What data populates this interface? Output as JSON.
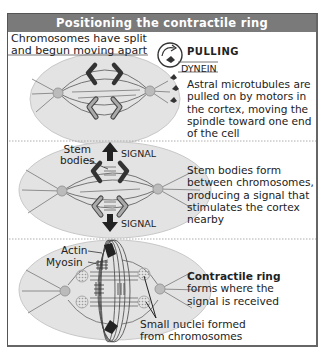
{
  "title": "Positioning the contractile ring",
  "colors": {
    "header_bg": "#7a7a7a",
    "header_text": "#ffffff",
    "cell_fill": "#e3e3e3",
    "chromosome_dark": "#333333",
    "chromosome_light": "#999999",
    "frame_border": "#555555"
  },
  "panels": [
    {
      "id": "pulling",
      "caption_top": [
        "Chromosomes have split",
        "and begun moving apart"
      ],
      "inset_title": "PULLING",
      "inset_subtitle": "DYNEIN",
      "description": [
        "Astral microtubules are",
        "pulled on by motors in",
        "the cortex, moving the",
        "spindle toward one end",
        "of the cell"
      ]
    },
    {
      "id": "signal",
      "labels": {
        "stem_bodies": [
          "Stem",
          "bodies"
        ],
        "signal_top": "SIGNAL",
        "signal_bottom": "SIGNAL"
      },
      "description": [
        "Stem bodies form",
        "between chromosomes,",
        "producing a signal that",
        "stimulates the cortex",
        "nearby"
      ]
    },
    {
      "id": "ring",
      "labels": {
        "actin": "Actin",
        "myosin": "Myosin",
        "small_nuclei": [
          "Small nuclei formed",
          "from chromosomes"
        ]
      },
      "description_bold": "Contractile ring",
      "description": [
        "forms where the",
        "signal is received"
      ]
    }
  ]
}
